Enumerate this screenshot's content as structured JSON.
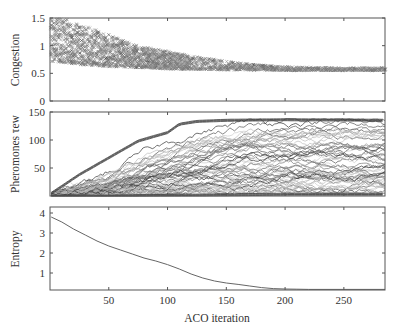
{
  "figure": {
    "xlabel": "ACO iteration",
    "x_ticks": [
      50,
      100,
      150,
      200,
      250
    ],
    "xlim": [
      0,
      285
    ]
  },
  "chart_data": [
    {
      "type": "scatter",
      "title": "",
      "xlabel": "ACO iteration",
      "ylabel": "Congestion",
      "xlim": [
        0,
        285
      ],
      "ylim": [
        0,
        1.5
      ],
      "y_ticks": [
        0,
        0.5,
        1,
        1.5
      ],
      "y_tick_labels": [
        "0",
        "0.5",
        "1",
        "1.5"
      ],
      "marker": "x",
      "grid": false,
      "description": "Many ants per iteration; spread of congestion values narrows and converges",
      "envelope": {
        "x": [
          0,
          10,
          25,
          50,
          75,
          100,
          125,
          150,
          175,
          200,
          250,
          285
        ],
        "upper": [
          1.5,
          1.5,
          1.4,
          1.2,
          1.0,
          0.9,
          0.8,
          0.72,
          0.66,
          0.62,
          0.6,
          0.6
        ],
        "lower": [
          0.72,
          0.7,
          0.66,
          0.62,
          0.6,
          0.58,
          0.57,
          0.56,
          0.56,
          0.55,
          0.55,
          0.55
        ]
      }
    },
    {
      "type": "line",
      "title": "",
      "xlabel": "ACO iteration",
      "ylabel": "Pheromones τew",
      "xlim": [
        0,
        285
      ],
      "ylim": [
        0,
        150
      ],
      "y_ticks": [
        50,
        100,
        150
      ],
      "y_tick_labels": [
        "50",
        "100",
        "150"
      ],
      "grid": false,
      "description": "Many pheromone trajectories (one per edge), rising from ~0 and saturating near 135 after ~110 iterations",
      "series_count": 60,
      "upper_envelope": {
        "x": [
          0,
          25,
          50,
          75,
          100,
          110,
          125,
          150,
          200,
          285
        ],
        "y": [
          5,
          40,
          70,
          100,
          115,
          130,
          135,
          137,
          138,
          137
        ]
      },
      "lower_envelope": {
        "x": [
          0,
          50,
          100,
          150,
          200,
          285
        ],
        "y": [
          2,
          2,
          3,
          4,
          5,
          5
        ]
      }
    },
    {
      "type": "line",
      "title": "",
      "xlabel": "ACO iteration",
      "ylabel": "Entropy",
      "xlim": [
        0,
        285
      ],
      "ylim": [
        0.15,
        4.3
      ],
      "y_ticks": [
        1,
        2,
        3,
        4
      ],
      "y_tick_labels": [
        "1",
        "2",
        "3",
        "4"
      ],
      "grid": false,
      "series": [
        {
          "name": "Entropy",
          "x": [
            1,
            10,
            20,
            30,
            40,
            50,
            60,
            70,
            80,
            90,
            100,
            110,
            120,
            130,
            140,
            150,
            160,
            170,
            180,
            190,
            200,
            210,
            220,
            250,
            285
          ],
          "values": [
            3.8,
            3.55,
            3.2,
            2.9,
            2.6,
            2.35,
            2.15,
            1.95,
            1.75,
            1.6,
            1.42,
            1.2,
            0.95,
            0.75,
            0.6,
            0.5,
            0.43,
            0.35,
            0.27,
            0.22,
            0.2,
            0.19,
            0.18,
            0.18,
            0.18
          ]
        }
      ]
    }
  ]
}
